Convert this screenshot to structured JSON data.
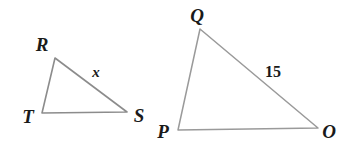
{
  "figure": {
    "type": "geometry-diagram",
    "background_color": "#ffffff",
    "stroke_color": "#8c8c8c",
    "stroke_color_light": "#a8a8a8",
    "label_color": "#1a1a1a",
    "width": 344,
    "height": 154,
    "triangles": [
      {
        "name": "triangle-RTS",
        "vertices": [
          {
            "label": "R",
            "x": 55,
            "y": 58,
            "label_x": 42,
            "label_y": 44
          },
          {
            "label": "T",
            "x": 42,
            "y": 113,
            "label_x": 28,
            "label_y": 116
          },
          {
            "label": "S",
            "x": 127,
            "y": 112,
            "label_x": 139,
            "label_y": 115
          }
        ],
        "path": "M 55 58 L 127 112 L 42 113 Z",
        "side_labels": [
          {
            "text": "x",
            "x": 96,
            "y": 72,
            "style": "italic"
          }
        ]
      },
      {
        "name": "triangle-QPO",
        "vertices": [
          {
            "label": "Q",
            "x": 200,
            "y": 29,
            "label_x": 197,
            "label_y": 15
          },
          {
            "label": "P",
            "x": 178,
            "y": 130,
            "label_x": 163,
            "label_y": 131
          },
          {
            "label": "O",
            "x": 318,
            "y": 128,
            "label_x": 329,
            "label_y": 131
          }
        ],
        "path": "M 200 29 L 318 128 L 178 130 Z",
        "side_labels": [
          {
            "text": "15",
            "x": 273,
            "y": 72,
            "style": "numeric"
          }
        ]
      }
    ]
  }
}
